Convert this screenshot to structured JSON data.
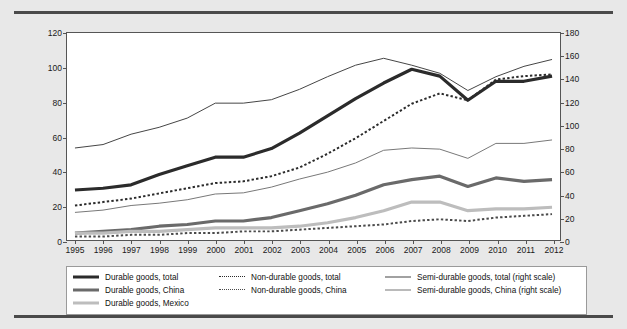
{
  "chart_data": {
    "type": "line",
    "title": "",
    "xlabel": "",
    "ylabel": "",
    "ylabel_right": "",
    "grid": false,
    "legend_position": "bottom",
    "x": [
      1995,
      1996,
      1997,
      1998,
      1999,
      2000,
      2001,
      2002,
      2003,
      2004,
      2005,
      2006,
      2007,
      2008,
      2009,
      2010,
      2011,
      2012
    ],
    "ylim": [
      0,
      120
    ],
    "yticks": [
      0,
      20,
      40,
      60,
      80,
      100,
      120
    ],
    "ylim_right": [
      0,
      180
    ],
    "yticks_right": [
      0,
      20,
      40,
      60,
      80,
      100,
      120,
      140,
      160,
      180
    ],
    "series": [
      {
        "name": "Durable goods, total",
        "axis": "left",
        "style": "solid",
        "width": "thick",
        "color": "#2b2b2b",
        "values": [
          29,
          30,
          32,
          38,
          43,
          48,
          48,
          53,
          62,
          72,
          82,
          91,
          99,
          95,
          81,
          92,
          92,
          95
        ]
      },
      {
        "name": "Durable goods, China",
        "axis": "left",
        "style": "solid",
        "width": "thick",
        "color": "#6a6a6a",
        "values": [
          4,
          5,
          6,
          8,
          9,
          11,
          11,
          13,
          17,
          21,
          26,
          32,
          35,
          37,
          31,
          36,
          34,
          35
        ]
      },
      {
        "name": "Durable goods, Mexico",
        "axis": "left",
        "style": "solid",
        "width": "thick",
        "color": "#bdbdbd",
        "values": [
          4,
          4,
          5,
          5,
          6,
          7,
          7,
          7,
          8,
          10,
          13,
          17,
          22,
          22,
          17,
          18,
          18,
          19
        ]
      },
      {
        "name": "Non-durable goods, total",
        "axis": "left",
        "style": "dotted",
        "width": "medium",
        "color": "#2b2b2b",
        "values": [
          20,
          22,
          24,
          27,
          30,
          33,
          34,
          37,
          42,
          50,
          59,
          69,
          79,
          85,
          81,
          93,
          95,
          96
        ]
      },
      {
        "name": "Non-durable goods, China",
        "axis": "left",
        "style": "dotted",
        "width": "medium",
        "color": "#4a4a4a",
        "values": [
          2,
          2,
          3,
          3,
          4,
          4,
          5,
          5,
          6,
          7,
          8,
          9,
          11,
          12,
          11,
          13,
          14,
          15
        ]
      },
      {
        "name": "Semi-durable goods, total (right scale)",
        "axis": "right",
        "style": "solid",
        "width": "thin",
        "color": "#444444",
        "values": [
          80,
          83,
          92,
          98,
          106,
          119,
          119,
          122,
          131,
          142,
          152,
          158,
          152,
          145,
          130,
          142,
          151,
          157
        ]
      },
      {
        "name": "Semi-durable goods, China (right scale)",
        "axis": "right",
        "style": "solid",
        "width": "thin",
        "color": "#777777",
        "values": [
          24,
          26,
          30,
          32,
          35,
          40,
          41,
          46,
          53,
          59,
          67,
          78,
          80,
          79,
          71,
          84,
          84,
          87
        ]
      }
    ]
  },
  "legend": {
    "items": [
      {
        "label": "Durable goods, total"
      },
      {
        "label": "Non-durable goods, total"
      },
      {
        "label": "Semi-durable goods, total (right scale)"
      },
      {
        "label": "Durable goods, China"
      },
      {
        "label": "Non-durable goods, China"
      },
      {
        "label": "Semi-durable goods, China (right scale)"
      },
      {
        "label": "Durable goods, Mexico"
      }
    ]
  }
}
